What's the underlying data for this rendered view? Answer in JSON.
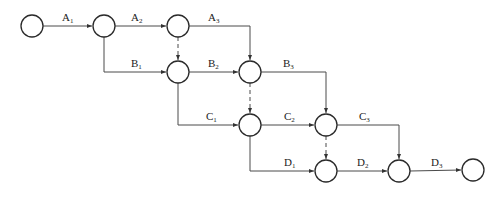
{
  "diagram": {
    "type": "activity-on-arrow network",
    "nodes": [
      {
        "id": "n1",
        "x": 32,
        "y": 26
      },
      {
        "id": "n2",
        "x": 104,
        "y": 26
      },
      {
        "id": "n3",
        "x": 178,
        "y": 26
      },
      {
        "id": "n4",
        "x": 178,
        "y": 72
      },
      {
        "id": "n5",
        "x": 250,
        "y": 72
      },
      {
        "id": "n6",
        "x": 250,
        "y": 125
      },
      {
        "id": "n7",
        "x": 326,
        "y": 125
      },
      {
        "id": "n8",
        "x": 326,
        "y": 171
      },
      {
        "id": "n9",
        "x": 399,
        "y": 171
      },
      {
        "id": "n10",
        "x": 473,
        "y": 170
      }
    ],
    "activities": [
      {
        "id": "A1",
        "letter": "A",
        "sub": "1",
        "from": "n1",
        "to": "n2"
      },
      {
        "id": "A2",
        "letter": "A",
        "sub": "2",
        "from": "n2",
        "to": "n3"
      },
      {
        "id": "A3",
        "letter": "A",
        "sub": "3",
        "from": "n3",
        "to": "n5"
      },
      {
        "id": "B1",
        "letter": "B",
        "sub": "1",
        "from": "n2",
        "to": "n4"
      },
      {
        "id": "B2",
        "letter": "B",
        "sub": "2",
        "from": "n4",
        "to": "n5"
      },
      {
        "id": "B3",
        "letter": "B",
        "sub": "3",
        "from": "n5",
        "to": "n7"
      },
      {
        "id": "C1",
        "letter": "C",
        "sub": "1",
        "from": "n4",
        "to": "n6"
      },
      {
        "id": "C2",
        "letter": "C",
        "sub": "2",
        "from": "n6",
        "to": "n7"
      },
      {
        "id": "C3",
        "letter": "C",
        "sub": "3",
        "from": "n7",
        "to": "n9"
      },
      {
        "id": "D1",
        "letter": "D",
        "sub": "1",
        "from": "n6",
        "to": "n8"
      },
      {
        "id": "D2",
        "letter": "D",
        "sub": "2",
        "from": "n8",
        "to": "n9"
      },
      {
        "id": "D3",
        "letter": "D",
        "sub": "3",
        "from": "n9",
        "to": "n10"
      }
    ],
    "dummy_activities": [
      {
        "from": "n3",
        "to": "n4"
      },
      {
        "from": "n5",
        "to": "n6"
      },
      {
        "from": "n7",
        "to": "n8"
      }
    ],
    "labels": {
      "A1": {
        "letter": "A",
        "sub": "1"
      },
      "A2": {
        "letter": "A",
        "sub": "2"
      },
      "A3": {
        "letter": "A",
        "sub": "3"
      },
      "B1": {
        "letter": "B",
        "sub": "1"
      },
      "B2": {
        "letter": "B",
        "sub": "2"
      },
      "B3": {
        "letter": "B",
        "sub": "3"
      },
      "C1": {
        "letter": "C",
        "sub": "1"
      },
      "C2": {
        "letter": "C",
        "sub": "2"
      },
      "C3": {
        "letter": "C",
        "sub": "3"
      },
      "D1": {
        "letter": "D",
        "sub": "1"
      },
      "D2": {
        "letter": "D",
        "sub": "2"
      },
      "D3": {
        "letter": "D",
        "sub": "3"
      }
    }
  }
}
